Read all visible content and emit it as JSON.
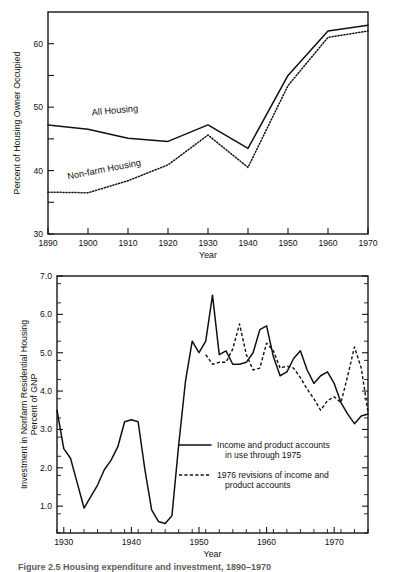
{
  "figure": {
    "caption": "Figure 2.5  Housing expenditure and investment, 1890–1970"
  },
  "chart_data": [
    {
      "id": "owner-occupancy",
      "type": "line",
      "title": "",
      "xlabel": "Year",
      "ylabel": "Percent of Housing Owner Occupied",
      "xlim": [
        1890,
        1970
      ],
      "ylim": [
        30,
        65
      ],
      "xticks": [
        1890,
        1900,
        1910,
        1920,
        1930,
        1940,
        1950,
        1960,
        1970
      ],
      "xtick_labels": [
        "1890",
        "1900",
        "1910",
        "1920",
        "1930",
        "1940",
        "1950",
        "1960",
        "1970"
      ],
      "yticks": [
        30,
        35,
        40,
        45,
        50,
        55,
        60
      ],
      "ytick_labels": [
        "30",
        "",
        "40",
        "",
        "50",
        "",
        "60"
      ],
      "grid": false,
      "legend_position": "inline-labels",
      "series": [
        {
          "name": "All Housing",
          "style": "solid",
          "label_x": 1901,
          "label_y": 48.7,
          "label_rotation": -5,
          "x": [
            1890,
            1900,
            1910,
            1920,
            1930,
            1940,
            1950,
            1960,
            1970
          ],
          "values": [
            47.2,
            46.5,
            45.1,
            44.6,
            47.2,
            43.5,
            55.0,
            62.0,
            62.9
          ]
        },
        {
          "name": "Non-farm Housing",
          "style": "dotted",
          "label_x": 1895,
          "label_y": 38.6,
          "label_rotation": -11,
          "x": [
            1890,
            1900,
            1910,
            1920,
            1930,
            1940,
            1950,
            1960,
            1970
          ],
          "values": [
            36.6,
            36.5,
            38.4,
            40.9,
            45.6,
            40.5,
            53.4,
            61.0,
            62.0
          ]
        }
      ]
    },
    {
      "id": "residential-investment",
      "type": "line",
      "title": "",
      "xlabel": "Year",
      "ylabel": "Investment in Nonfarm Residential Housing\nPercent of GNP",
      "ylabel_line1": "Investment in Nonfarm Residential Housing",
      "ylabel_line2": "Percent of GNP",
      "xlim": [
        1929,
        1975
      ],
      "ylim": [
        0.3,
        7.0
      ],
      "xticks": [
        1930,
        1940,
        1950,
        1960,
        1970
      ],
      "xtick_labels": [
        "1930",
        "1940",
        "1950",
        "1960",
        "1970"
      ],
      "xtick_minor_step": 2,
      "yticks": [
        1.0,
        2.0,
        3.0,
        4.0,
        5.0,
        6.0,
        7.0
      ],
      "ytick_labels": [
        "1.0",
        "2.0",
        "3.0",
        "4.0",
        "5.0",
        "6.0",
        "7.0"
      ],
      "ytick_minor_step": 0.5,
      "grid": false,
      "legend_position": "inside-lower-right",
      "series": [
        {
          "name": "Income and product accounts in use through 1975",
          "legend_line1": "Income and product accounts",
          "legend_line2": "in use through 1975",
          "style": "solid",
          "x": [
            1929,
            1930,
            1931,
            1932,
            1933,
            1934,
            1935,
            1936,
            1937,
            1938,
            1939,
            1940,
            1941,
            1942,
            1943,
            1944,
            1945,
            1946,
            1947,
            1948,
            1949,
            1950,
            1951,
            1952,
            1953,
            1954,
            1955,
            1956,
            1957,
            1958,
            1959,
            1960,
            1961,
            1962,
            1963,
            1964,
            1965,
            1966,
            1967,
            1968,
            1969,
            1970,
            1971,
            1972,
            1973,
            1974,
            1975
          ],
          "values": [
            3.5,
            2.5,
            2.25,
            1.6,
            0.95,
            1.25,
            1.55,
            1.95,
            2.2,
            2.55,
            3.2,
            3.25,
            3.2,
            1.95,
            0.9,
            0.6,
            0.55,
            0.75,
            2.6,
            4.25,
            5.3,
            5.0,
            5.3,
            6.5,
            4.95,
            5.05,
            4.7,
            4.7,
            4.75,
            5.0,
            5.6,
            5.7,
            4.9,
            4.4,
            4.5,
            4.85,
            5.05,
            4.55,
            4.2,
            4.4,
            4.5,
            4.2,
            3.7,
            3.4,
            3.15,
            3.35,
            3.4,
            3.1,
            4.0,
            4.55,
            4.4,
            3.3,
            2.75
          ]
        },
        {
          "name": "1976 revisions of income and product accounts",
          "legend_line1": "1976 revisions of income and",
          "legend_line2": "product accounts",
          "style": "dashed",
          "x": [
            1951,
            1952,
            1953,
            1954,
            1955,
            1956,
            1957,
            1958,
            1959,
            1960,
            1961,
            1962,
            1963,
            1964,
            1965,
            1966,
            1967,
            1968,
            1969,
            1970,
            1971,
            1972,
            1973,
            1974,
            1975
          ],
          "values": [
            4.95,
            4.7,
            4.75,
            4.75,
            5.1,
            5.75,
            4.95,
            4.55,
            4.6,
            5.25,
            5.05,
            4.6,
            4.65,
            4.6,
            4.35,
            4.05,
            3.8,
            3.5,
            3.75,
            3.85,
            3.7,
            4.4,
            5.15,
            4.6,
            3.45
          ]
        }
      ]
    }
  ]
}
